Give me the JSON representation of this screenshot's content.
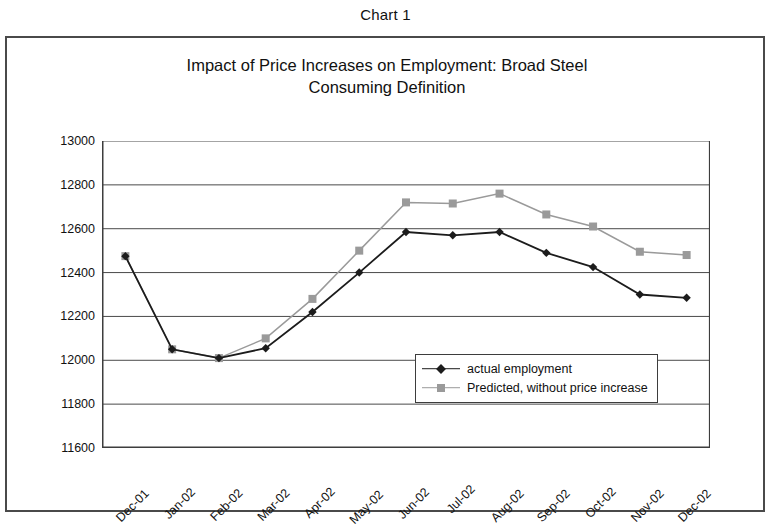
{
  "figure": {
    "caption": "Chart 1",
    "title_line1": "Impact of Price Increases on Employment: Broad Steel",
    "title_line2": "Consuming Definition"
  },
  "colors": {
    "actual": "#1c1c1c",
    "predicted": "#9a9a9a",
    "axis": "#3d3d3d",
    "grid": "#4a4a4a",
    "frame": "#4a4a4a",
    "background": "#ffffff"
  },
  "legend": {
    "position": "inside-center-right",
    "entries": [
      {
        "label": "actual employment",
        "marker": "diamond",
        "color": "#1c1c1c"
      },
      {
        "label": "Predicted, without price increase",
        "marker": "square",
        "color": "#9a9a9a"
      }
    ]
  },
  "chart_data": {
    "type": "line",
    "title": "Impact of Price Increases on Employment: Broad Steel Consuming Definition",
    "xlabel": "",
    "ylabel": "Thousands",
    "ylim": [
      11600,
      13000
    ],
    "yticks": [
      11600,
      11800,
      12000,
      12200,
      12400,
      12600,
      12800,
      13000
    ],
    "ytick_labels": [
      "11600",
      "11800",
      "12000",
      "12200",
      "12400",
      "12600",
      "12800",
      "13000"
    ],
    "grid": "horizontal",
    "legend_position": "center-right inside plot",
    "categories": [
      "Dec-01",
      "Jan-02",
      "Feb-02",
      "Mar-02",
      "Apr-02",
      "May-02",
      "Jun-02",
      "Jul-02",
      "Aug-02",
      "Sep-02",
      "Oct-02",
      "Nov-02",
      "Dec-02"
    ],
    "series": [
      {
        "name": "actual employment",
        "marker": "diamond",
        "color": "#1c1c1c",
        "values": [
          12475,
          12050,
          12010,
          12055,
          12220,
          12400,
          12585,
          12570,
          12585,
          12490,
          12425,
          12300,
          12285
        ]
      },
      {
        "name": "Predicted, without price increase",
        "marker": "square",
        "color": "#9a9a9a",
        "values": [
          12475,
          12050,
          12010,
          12100,
          12280,
          12500,
          12720,
          12715,
          12760,
          12665,
          12610,
          12495,
          12480
        ]
      }
    ]
  }
}
